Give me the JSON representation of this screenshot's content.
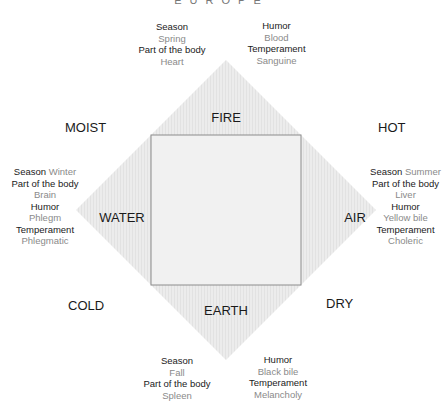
{
  "title": "EUROPE",
  "colors": {
    "diamond_fill": "#e9e9e9",
    "square_stroke": "#8c8c8c",
    "key_text": "#1a1a1a",
    "value_text": "#8a8a8a"
  },
  "elements": {
    "fire": "FIRE",
    "water": "WATER",
    "air": "AIR",
    "earth": "EARTH"
  },
  "qualities": {
    "moist": "MOIST",
    "hot": "HOT",
    "cold": "COLD",
    "dry": "DRY"
  },
  "spring_block": {
    "season_label": "Season",
    "season": "Spring",
    "body_label": "Part of the body",
    "body": "Heart"
  },
  "blood_block": {
    "humor_label": "Humor",
    "humor": "Blood",
    "temperament_label": "Temperament",
    "temperament": "Sanguine"
  },
  "winter_block": {
    "season_label": "Season",
    "season": "Winter",
    "body_label": "Part of the body",
    "body": "Brain",
    "humor_label": "Humor",
    "humor": "Phlegm",
    "temperament_label": "Temperament",
    "temperament": "Phlegmatic"
  },
  "summer_block": {
    "season_label": "Season",
    "season": "Summer",
    "body_label": "Part of the body",
    "body": "Liver",
    "humor_label": "Humor",
    "humor": "Yellow bile",
    "temperament_label": "Temperament",
    "temperament": "Choleric"
  },
  "fall_block": {
    "season_label": "Season",
    "season": "Fall",
    "body_label": "Part of the body",
    "body": "Spleen"
  },
  "blackbile_block": {
    "humor_label": "Humor",
    "humor": "Black bile",
    "temperament_label": "Temperament",
    "temperament": "Melancholy"
  }
}
